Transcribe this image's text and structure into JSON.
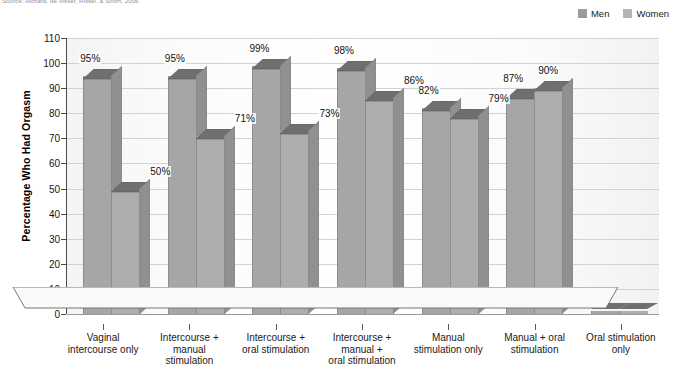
{
  "source": "Source: Richard, de Visser, Rissel, & Smith, 2006",
  "legend": {
    "position": "top-right",
    "items": [
      {
        "label": "Men",
        "color": "#9b9b9b"
      },
      {
        "label": "Women",
        "color": "#b5b5b5"
      }
    ]
  },
  "axes": {
    "ylabel": "Percentage Who Had Orgasm",
    "yticks": [
      "0",
      "10",
      "20",
      "30",
      "40",
      "50",
      "60",
      "70",
      "80",
      "90",
      "100",
      "110"
    ],
    "ylim_min": 0,
    "ylim_max": 110,
    "grid": true
  },
  "chart_data": {
    "type": "bar",
    "title": "",
    "xlabel": "",
    "ylabel": "Percentage Who Had Orgasm",
    "ylim": [
      0,
      110
    ],
    "grid": true,
    "legend_position": "top-right",
    "categories": [
      "Vaginal intercourse only",
      "Intercourse + manual stimulation",
      "Intercourse + oral stimulation",
      "Intercourse + manual + oral stimulation",
      "Manual stimulation only",
      "Manual + oral stimulation",
      "Oral stimulation only"
    ],
    "category_lines": [
      [
        "Vaginal",
        "intercourse only"
      ],
      [
        "Intercourse +",
        "manual",
        "stimulation"
      ],
      [
        "Intercourse +",
        "oral stimulation"
      ],
      [
        "Intercourse +",
        "manual +",
        "oral stimulation"
      ],
      [
        "Manual",
        "stimulation only"
      ],
      [
        "Manual + oral",
        "stimulation"
      ],
      [
        "Oral stimulation",
        "only"
      ]
    ],
    "series": [
      {
        "name": "Men",
        "color": "#a8a8a8",
        "values": [
          95,
          95,
          99,
          98,
          82,
          87,
          0
        ],
        "labels": [
          "95%",
          "95%",
          "99%",
          "98%",
          "82%",
          "87%",
          ""
        ]
      },
      {
        "name": "Women",
        "color": "#a8a8a8",
        "values": [
          50,
          71,
          73,
          86,
          79,
          90,
          0
        ],
        "labels": [
          "50%",
          "71%",
          "73%",
          "86%",
          "79%",
          "90%",
          ""
        ]
      }
    ]
  }
}
